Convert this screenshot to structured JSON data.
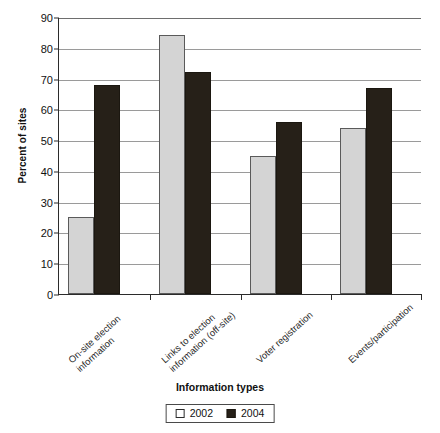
{
  "chart_data": {
    "type": "bar",
    "title": "",
    "xlabel": "Information types",
    "ylabel": "Percent of sites",
    "categories": [
      "On-site election\ninformation",
      "Links to election\ninformation (off-site)",
      "Voter registration",
      "Events/participation"
    ],
    "series": [
      {
        "name": "2002",
        "values": [
          25,
          84,
          45,
          54
        ],
        "color": "#d4d4d4"
      },
      {
        "name": "2004",
        "values": [
          68,
          72,
          56,
          67
        ],
        "color": "#262018"
      }
    ],
    "ylim": [
      0,
      90
    ],
    "ytick_values": [
      0,
      10,
      20,
      30,
      40,
      50,
      60,
      70,
      80,
      90
    ],
    "ytick_labels": [
      "0",
      "10",
      "20",
      "30",
      "40",
      "50",
      "60",
      "70",
      "80",
      "90"
    ],
    "grid": true,
    "legend_position": "bottom"
  },
  "legend": {
    "entries": [
      {
        "label": "2002",
        "swatch": "light-square-icon"
      },
      {
        "label": "2004",
        "swatch": "dark-square-icon"
      }
    ]
  }
}
